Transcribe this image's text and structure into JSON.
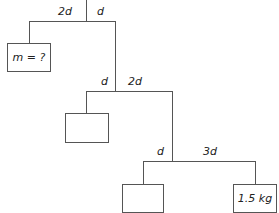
{
  "diagram": {
    "top_bar": {
      "left_arm": "2d",
      "right_arm": "d"
    },
    "middle_bar": {
      "left_arm": "d",
      "right_arm": "2d"
    },
    "bottom_bar": {
      "left_arm": "d",
      "right_arm": "3d"
    },
    "boxes": {
      "unknown_mass": "m = ?",
      "middle_left": "",
      "bottom_left": "",
      "bottom_right": "1.5 kg"
    }
  }
}
